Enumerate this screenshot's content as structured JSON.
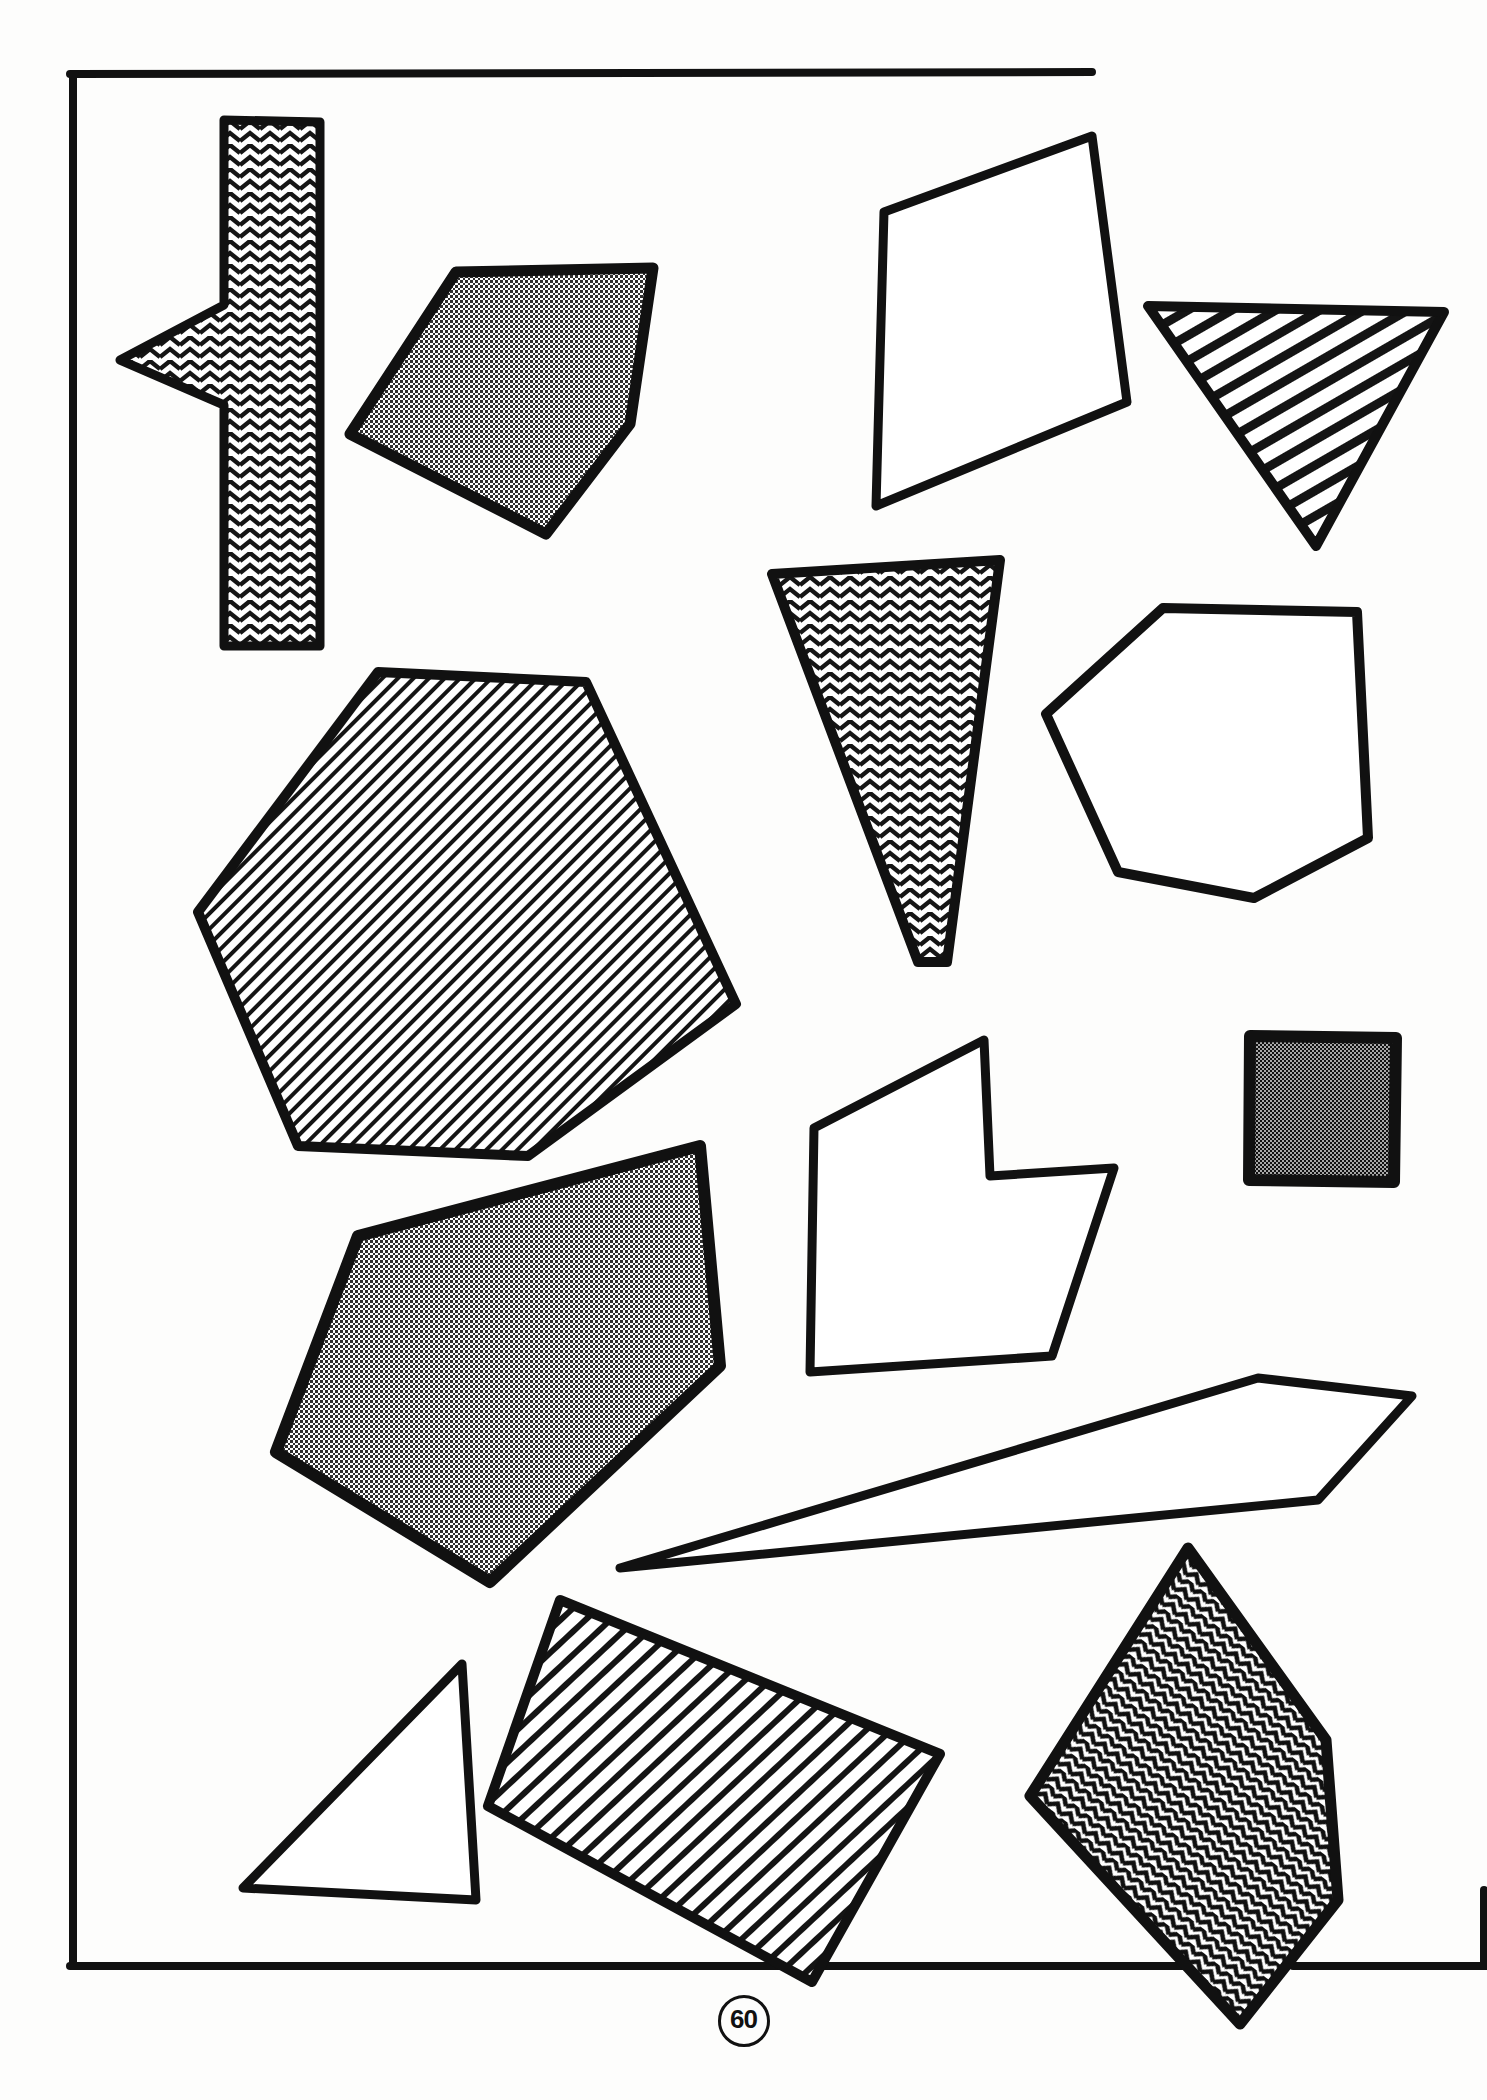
{
  "page": {
    "page_number": "60",
    "background_color": "#fdfdfc",
    "ink_color": "#111111",
    "width": 1487,
    "height": 2100
  },
  "frame": {
    "name": "page-border",
    "left": 70,
    "top": 72,
    "right": 1090,
    "bottom": 1968,
    "stroke_width": 7,
    "bottom_gap_start": 1205,
    "bottom_gap_end": 1300,
    "bottom_tail_start": 1310,
    "bottom_tail_end": 1487,
    "right_edge_visible": false
  },
  "shapes": [
    {
      "id": "chevron-cross-arrow",
      "name": "chevron-cross-arrow",
      "fill": "herringbone",
      "points": "222,118 320,118 320,330 325,322 205,385 230,330 222,330 222,645 168,645 168,330 115,355 168,300 168,118",
      "description": "tall vertical bar with a left pointing barb, herringbone filled"
    },
    {
      "id": "gray-pentagon-top-left",
      "name": "gray-pentagon-top-left",
      "fill": "halftone-gray",
      "points": "455,272 650,268 630,425 545,535 350,432",
      "description": "gray dotted pentagon upper left of centre"
    },
    {
      "id": "open-quadrilateral-top",
      "name": "open-quadrilateral-top",
      "fill": "none",
      "points": "885,210 1090,135 1125,400 878,505",
      "description": "plain outlined quadrilateral near top centre-right"
    },
    {
      "id": "hatched-triangle-top-right",
      "name": "hatched-triangle-top-right",
      "fill": "diagonal-hatch-thick",
      "points": "1148,305 1440,312 1315,545",
      "description": "downward pointing triangle with thick diagonal hatch"
    },
    {
      "id": "chevron-triangle-center",
      "name": "chevron-triangle-center",
      "fill": "herringbone",
      "points": "772,572 1000,560 945,965 915,965",
      "description": "narrow herringbone wedge in the centre"
    },
    {
      "id": "open-heptagon-right",
      "name": "open-heptagon-right",
      "fill": "none",
      "points": "1163,608 1355,612 1368,838 1255,898 1118,870 1046,715",
      "description": "plain outlined heptagon on the right"
    },
    {
      "id": "hatched-hexagon-large",
      "name": "hatched-hexagon-large",
      "fill": "diagonal-hatch-fine",
      "points": "378,673 585,680 735,1002 530,1155 300,1145 200,910",
      "description": "large fine diagonally hatched hexagon"
    },
    {
      "id": "dark-square-right",
      "name": "dark-square-right",
      "fill": "dense-checker",
      "points": "1248,1035 1395,1035 1395,1180 1248,1180",
      "description": "small dark checkered square far right"
    },
    {
      "id": "concave-arrow-polygon",
      "name": "concave-arrow-polygon",
      "fill": "none",
      "points": "985,1040 990,1175 1112,1168 1052,1355 810,1370 812,1128",
      "description": "concave arrow-like outlined polygon centre right"
    },
    {
      "id": "gray-pentagon-lower-left",
      "name": "gray-pentagon-lower-left",
      "fill": "halftone-gray",
      "points": "700,1145 718,1365 490,1580 275,1450 357,1235",
      "description": "large gray dotted pentagon lower left"
    },
    {
      "id": "sliver-quadrilateral",
      "name": "sliver-quadrilateral",
      "fill": "none",
      "points": "1258,1378 1410,1395 1318,1500 620,1565",
      "description": "long thin outlined sliver quadrilateral"
    },
    {
      "id": "hatched-rectangle-bottom",
      "name": "hatched-rectangle-bottom",
      "fill": "diagonal-hatch-medium",
      "points": "560,1600 938,1752 812,1980 488,1805",
      "description": "rotated hatched rectangle bottom centre"
    },
    {
      "id": "open-triangle-bottom-left",
      "name": "open-triangle-bottom-left",
      "fill": "none",
      "points": "462,1665 475,1900 243,1888",
      "description": "plain outlined right triangle bottom left"
    },
    {
      "id": "chevron-kite-bottom-right",
      "name": "chevron-kite-bottom-right",
      "fill": "herringbone-dark",
      "points": "1188,1548 1325,1738 1338,1898 1238,2020 1030,1795",
      "description": "herringbone filled kite bottom right"
    }
  ],
  "patterns": {
    "herringbone": {
      "label": "herringbone",
      "color": "#151515",
      "background": "#ffffff"
    },
    "herringbone-dark": {
      "label": "herringbone-dark",
      "color": "#101010",
      "background": "#ffffff"
    },
    "halftone-gray": {
      "label": "halftone-gray",
      "color": "#2a2a2a",
      "background": "#ffffff"
    },
    "diagonal-hatch-fine": {
      "label": "diagonal-hatch-fine",
      "color": "#141414",
      "background": "#ffffff"
    },
    "diagonal-hatch-medium": {
      "label": "diagonal-hatch-medium",
      "color": "#141414",
      "background": "#ffffff"
    },
    "diagonal-hatch-thick": {
      "label": "diagonal-hatch-thick",
      "color": "#141414",
      "background": "#ffffff"
    },
    "dense-checker": {
      "label": "dense-checker",
      "color": "#1a1a1a",
      "background": "#8d8d8d"
    }
  }
}
